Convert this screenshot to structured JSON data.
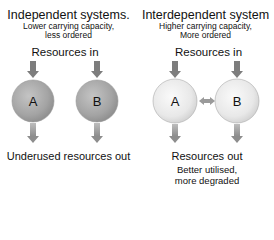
{
  "left_panel": {
    "title": "Independent systems.",
    "subtitle_line1": "Lower carrying capacity,",
    "subtitle_line2": "less ordered",
    "input_label": "Resources in",
    "nodes": [
      "A",
      "B"
    ],
    "output_label": "Underused resources out",
    "colors": {
      "node_fill": "#a8a8a8",
      "arrow": "#7a7a7a"
    }
  },
  "right_panel": {
    "title": "Interdependent system",
    "subtitle_line1": "Higher carrying capacity,",
    "subtitle_line2": "More ordered",
    "input_label": "Resources in",
    "nodes": [
      "A",
      "B"
    ],
    "link": "bidirectional-arrow",
    "output_label": "Resources out",
    "output_sub_line1": "Better utilised,",
    "output_sub_line2": "more degraded",
    "colors": {
      "node_fill": "#e6e6e6",
      "arrow": "#8a8a8a"
    }
  }
}
